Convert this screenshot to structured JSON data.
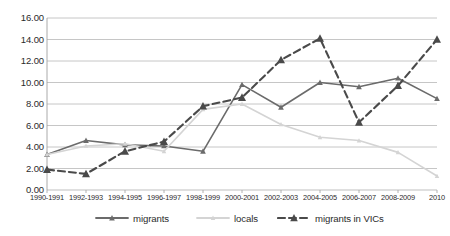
{
  "chart_data": {
    "type": "line",
    "title": "",
    "subtitle": "",
    "xlabel": "",
    "ylabel": "",
    "ylim": [
      0,
      16
    ],
    "ytick_step": 2,
    "grid": true,
    "legend_position": "bottom",
    "categories": [
      "1990-1991",
      "1992-1993",
      "1994-1995",
      "1996-1997",
      "1998-1999",
      "2000-2001",
      "2002-2003",
      "2004-2005",
      "2006-2007",
      "2008-2009",
      "2010"
    ],
    "ytick_labels": [
      "0.00",
      "2.00",
      "4.00",
      "6.00",
      "8.00",
      "10.00",
      "12.00",
      "14.00",
      "16.00"
    ],
    "series": [
      {
        "name": "migrants",
        "color": "#6b6b6b",
        "style": "solid",
        "marker": "triangle",
        "values": [
          3.3,
          4.6,
          4.2,
          4.1,
          3.6,
          9.8,
          7.7,
          10.0,
          9.6,
          10.4,
          8.5
        ]
      },
      {
        "name": "locals",
        "color": "#d4d4d4",
        "style": "solid",
        "marker": "triangle",
        "values": [
          3.3,
          4.1,
          4.3,
          3.6,
          7.5,
          8.0,
          6.1,
          4.9,
          4.6,
          3.5,
          1.3
        ]
      },
      {
        "name": "migrants in VICs",
        "color": "#4a4a4a",
        "style": "dashed",
        "marker": "triangle",
        "values": [
          1.9,
          1.5,
          3.6,
          4.5,
          7.8,
          8.6,
          12.1,
          14.1,
          6.3,
          9.7,
          14.0
        ]
      }
    ]
  },
  "legend": {
    "items": [
      {
        "label": "migrants"
      },
      {
        "label": "locals"
      },
      {
        "label": "migrants in VICs"
      }
    ]
  },
  "colors": {
    "migrants": "#6b6b6b",
    "locals": "#d4d4d4",
    "migrants_in_vics": "#4a4a4a",
    "grid": "#b8b8b8",
    "axis": "#a0a0a0",
    "text": "#2b2b2b",
    "background": "#ffffff"
  }
}
